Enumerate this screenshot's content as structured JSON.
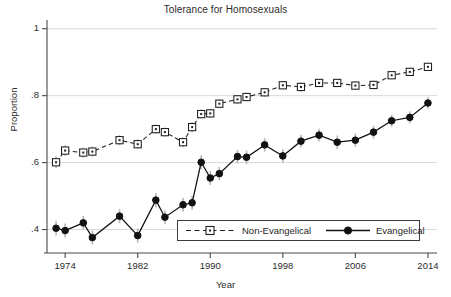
{
  "chart_data": {
    "type": "line",
    "title": "Tolerance for Homosexuals",
    "xlabel": "Year",
    "ylabel": "Proportion",
    "xlim": [
      1972,
      2015
    ],
    "ylim": [
      0.33,
      1.02
    ],
    "xticks": [
      1974,
      1982,
      1990,
      1998,
      2006,
      2014
    ],
    "xtick_labels": [
      "1974",
      "1982",
      "1990",
      "1998",
      "2006",
      "2014"
    ],
    "yticks": [
      0.4,
      0.6,
      0.8,
      1
    ],
    "ytick_labels": [
      ".4",
      ".6",
      ".8",
      "1"
    ],
    "grid": "horizontal",
    "legend_position": "lower-center-right",
    "error_bars": "vertical 95% confidence intervals, light gray",
    "series": [
      {
        "name": "Non-Evangelical",
        "marker": "open-square",
        "line_style": "dashed",
        "color": "#1f1f1f",
        "x": [
          1973,
          1974,
          1976,
          1977,
          1980,
          1982,
          1984,
          1985,
          1987,
          1988,
          1989,
          1990,
          1991,
          1993,
          1994,
          1996,
          1998,
          2000,
          2002,
          2004,
          2006,
          2008,
          2010,
          2012,
          2014
        ],
        "y": [
          0.601,
          0.636,
          0.63,
          0.633,
          0.667,
          0.655,
          0.7,
          0.691,
          0.661,
          0.706,
          0.745,
          0.747,
          0.776,
          0.789,
          0.796,
          0.81,
          0.831,
          0.826,
          0.838,
          0.838,
          0.83,
          0.832,
          0.861,
          0.871,
          0.886
        ]
      },
      {
        "name": "Evangelical",
        "marker": "filled-circle",
        "line_style": "solid",
        "color": "#111111",
        "x": [
          1973,
          1974,
          1976,
          1977,
          1980,
          1982,
          1984,
          1985,
          1987,
          1988,
          1989,
          1990,
          1991,
          1993,
          1994,
          1996,
          1998,
          2000,
          2002,
          2004,
          2006,
          2008,
          2010,
          2012,
          2014
        ],
        "y": [
          0.404,
          0.397,
          0.42,
          0.376,
          0.44,
          0.382,
          0.488,
          0.437,
          0.474,
          0.48,
          0.601,
          0.554,
          0.567,
          0.618,
          0.616,
          0.653,
          0.62,
          0.664,
          0.682,
          0.661,
          0.667,
          0.691,
          0.725,
          0.735,
          0.778
        ]
      }
    ],
    "error_low": {
      "Non-Evangelical": [
        0.583,
        0.62,
        0.615,
        0.618,
        0.652,
        0.64,
        0.686,
        0.677,
        0.646,
        0.691,
        0.731,
        0.733,
        0.762,
        0.776,
        0.783,
        0.797,
        0.819,
        0.812,
        0.826,
        0.826,
        0.817,
        0.819,
        0.849,
        0.859,
        0.874
      ],
      "Evangelical": [
        0.382,
        0.376,
        0.399,
        0.355,
        0.419,
        0.361,
        0.467,
        0.416,
        0.453,
        0.459,
        0.58,
        0.533,
        0.547,
        0.598,
        0.596,
        0.633,
        0.6,
        0.645,
        0.663,
        0.641,
        0.647,
        0.672,
        0.707,
        0.717,
        0.761
      ]
    },
    "error_high": {
      "Non-Evangelical": [
        0.619,
        0.652,
        0.645,
        0.648,
        0.682,
        0.67,
        0.714,
        0.705,
        0.676,
        0.721,
        0.759,
        0.761,
        0.79,
        0.802,
        0.809,
        0.823,
        0.843,
        0.84,
        0.85,
        0.85,
        0.843,
        0.845,
        0.873,
        0.883,
        0.898
      ],
      "Evangelical": [
        0.426,
        0.418,
        0.441,
        0.397,
        0.461,
        0.403,
        0.509,
        0.458,
        0.495,
        0.501,
        0.622,
        0.575,
        0.587,
        0.638,
        0.636,
        0.673,
        0.64,
        0.683,
        0.701,
        0.681,
        0.687,
        0.71,
        0.743,
        0.753,
        0.795
      ]
    }
  },
  "legend": {
    "items": [
      {
        "label": "Non-Evangelical",
        "marker": "open-square",
        "style": "dashed"
      },
      {
        "label": "Evangelical",
        "marker": "filled-circle",
        "style": "solid"
      }
    ]
  }
}
